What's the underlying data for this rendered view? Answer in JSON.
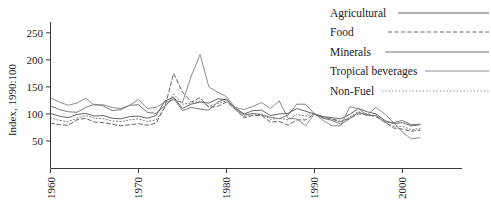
{
  "chart_data": {
    "type": "line",
    "title": "",
    "xlabel": "",
    "ylabel": "Index, 1990:100",
    "xlim": [
      1960,
      2002
    ],
    "ylim": [
      0,
      270
    ],
    "grid": false,
    "legend_position": "top-right",
    "xticks": [
      "1960",
      "1970",
      "1980",
      "1990",
      "2000"
    ],
    "xtick_values": [
      1960,
      1970,
      1980,
      1990,
      2000
    ],
    "yticks": [
      "50",
      "100",
      "150",
      "200",
      "250"
    ],
    "ytick_values": [
      50,
      100,
      150,
      200,
      250
    ],
    "x": [
      1960,
      1961,
      1962,
      1963,
      1964,
      1965,
      1966,
      1967,
      1968,
      1969,
      1970,
      1971,
      1972,
      1973,
      1974,
      1975,
      1976,
      1977,
      1978,
      1979,
      1980,
      1981,
      1982,
      1983,
      1984,
      1985,
      1986,
      1987,
      1988,
      1989,
      1990,
      1991,
      1992,
      1993,
      1994,
      1995,
      1996,
      1997,
      1998,
      1999,
      2000,
      2001,
      2002
    ],
    "series": [
      {
        "name": "Agricultural",
        "style": "solid",
        "color": "#555555",
        "values": [
          101,
          96,
          93,
          99,
          101,
          96,
          97,
          92,
          91,
          95,
          96,
          92,
          97,
          124,
          131,
          110,
          118,
          122,
          120,
          128,
          126,
          111,
          100,
          106,
          107,
          97,
          100,
          101,
          110,
          105,
          100,
          95,
          93,
          91,
          99,
          110,
          104,
          100,
          88,
          82,
          84,
          78,
          80
        ]
      },
      {
        "name": "Food",
        "style": "dashed",
        "color": "#555555",
        "values": [
          83,
          80,
          79,
          89,
          92,
          85,
          84,
          81,
          78,
          80,
          82,
          79,
          83,
          113,
          175,
          140,
          122,
          130,
          112,
          114,
          122,
          109,
          93,
          97,
          97,
          85,
          86,
          79,
          89,
          89,
          100,
          94,
          91,
          86,
          92,
          100,
          99,
          95,
          85,
          74,
          72,
          68,
          70
        ]
      },
      {
        "name": "Minerals",
        "style": "solid",
        "color": "#6a6a6a",
        "values": [
          115,
          108,
          104,
          103,
          112,
          118,
          115,
          106,
          108,
          116,
          117,
          103,
          101,
          115,
          129,
          106,
          112,
          109,
          107,
          122,
          128,
          110,
          98,
          101,
          98,
          94,
          91,
          98,
          118,
          118,
          100,
          92,
          88,
          81,
          91,
          103,
          97,
          97,
          85,
          84,
          88,
          80,
          81
        ]
      },
      {
        "name": "Tropical beverages",
        "style": "solid",
        "color": "#808080",
        "values": [
          130,
          122,
          116,
          120,
          129,
          116,
          117,
          112,
          110,
          116,
          127,
          110,
          112,
          122,
          126,
          121,
          170,
          210,
          150,
          140,
          132,
          112,
          108,
          114,
          121,
          110,
          124,
          92,
          91,
          78,
          100,
          88,
          78,
          78,
          113,
          110,
          98,
          112,
          100,
          84,
          66,
          54,
          56
        ]
      },
      {
        "name": "Non-Fuel",
        "style": "dotted",
        "color": "#707070",
        "values": [
          93,
          88,
          86,
          92,
          97,
          92,
          91,
          87,
          86,
          89,
          91,
          86,
          89,
          112,
          137,
          118,
          120,
          124,
          114,
          119,
          124,
          108,
          95,
          100,
          100,
          90,
          92,
          89,
          99,
          96,
          100,
          93,
          89,
          85,
          94,
          104,
          99,
          97,
          85,
          77,
          77,
          71,
          73
        ]
      }
    ]
  },
  "legend": {
    "items": [
      {
        "label": "Agricultural"
      },
      {
        "label": "Food"
      },
      {
        "label": "Minerals"
      },
      {
        "label": "Tropical beverages"
      },
      {
        "label": "Non-Fuel"
      }
    ]
  }
}
